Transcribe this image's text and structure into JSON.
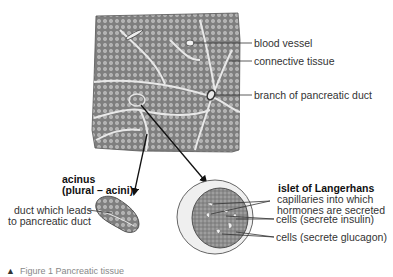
{
  "diagram": {
    "title": "Pancreatic tissue",
    "caption": {
      "marker": "▲",
      "text": "Figure 1  Pancreatic tissue"
    },
    "main_block_labels": [
      {
        "id": "blood-vessel",
        "text": "blood vessel"
      },
      {
        "id": "connective-tissue",
        "text": "connective tissue"
      },
      {
        "id": "branch-duct",
        "text": "branch of pancreatic duct"
      }
    ],
    "acinus": {
      "title_line1": "acinus",
      "title_line2": "(plural – acini)",
      "duct_label_line1": "duct which leads",
      "duct_label_line2": "to pancreatic duct"
    },
    "islet": {
      "title": "islet of Langerhans",
      "labels": [
        {
          "id": "capillaries",
          "line1": "capillaries into which",
          "line2": "hormones are secreted"
        },
        {
          "id": "insulin-cells",
          "line1": "cells (secrete insulin)"
        },
        {
          "id": "glucagon-cells",
          "line1": "cells (secrete glucagon)"
        }
      ]
    },
    "colors": {
      "tissue_fill": "#8a8a8a",
      "cell_fill": "#c8c8c8",
      "connective": "#e6e6e6",
      "islet_ring": "#eeeeee",
      "line": "#333333"
    }
  }
}
